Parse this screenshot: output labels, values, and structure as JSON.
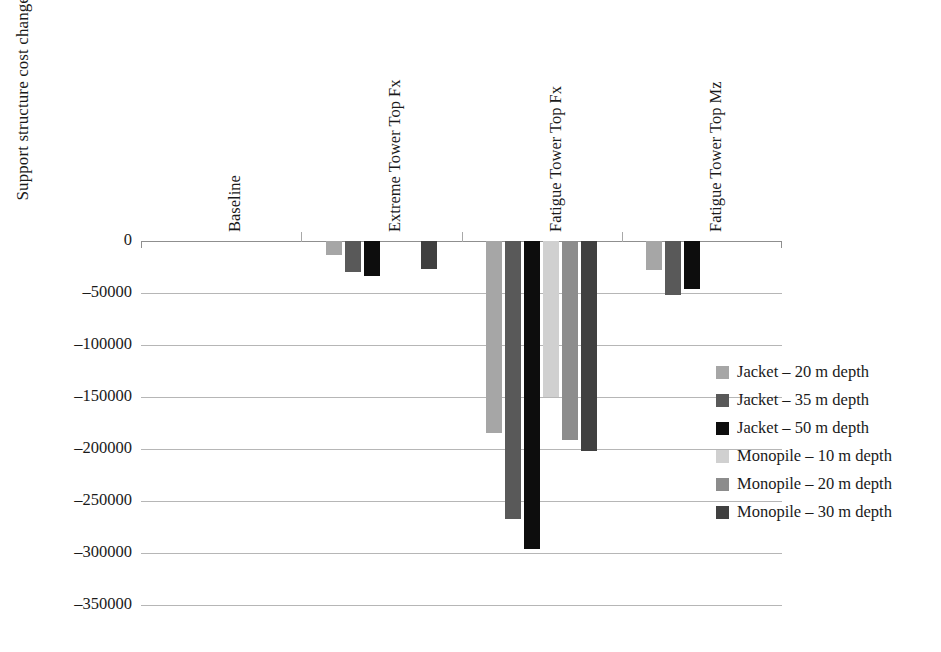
{
  "chart_data": {
    "type": "bar",
    "title": "",
    "xlabel": "",
    "ylabel": "Support structure cost change (€)",
    "ylim": [
      -350000,
      0
    ],
    "ytick_values": [
      0,
      -50000,
      -100000,
      -150000,
      -200000,
      -250000,
      -300000,
      -350000
    ],
    "ytick_labels": [
      "0",
      "–50000",
      "–100000",
      "–150000",
      "–200000",
      "–250000",
      "–300000",
      "–350000"
    ],
    "grid": true,
    "legend_position": "right",
    "categories": [
      "Baseline",
      "Extreme Tower Top Fx",
      "Fatigue Tower Top Fx",
      "Fatigue Tower Top Mz"
    ],
    "series": [
      {
        "name": "Jacket – 20 m depth",
        "color": "#a6a6a6",
        "values": [
          0,
          -13000,
          -185000,
          -28000
        ]
      },
      {
        "name": "Jacket – 35 m depth",
        "color": "#595959",
        "values": [
          0,
          -30000,
          -267000,
          -52000
        ]
      },
      {
        "name": "Jacket – 50 m depth",
        "color": "#0d0d0d",
        "values": [
          0,
          -34000,
          -296000,
          -46000
        ]
      },
      {
        "name": "Monopile – 10 m depth",
        "color": "#d0d0d0",
        "values": [
          0,
          0,
          -150000,
          0
        ]
      },
      {
        "name": "Monopile – 20 m depth",
        "color": "#8c8c8c",
        "values": [
          0,
          0,
          -191000,
          0
        ]
      },
      {
        "name": "Monopile – 30 m depth",
        "color": "#404040",
        "values": [
          0,
          -27000,
          -202000,
          0
        ]
      }
    ]
  },
  "legend": {
    "items": [
      "Jacket – 20 m depth",
      "Jacket – 35 m depth",
      "Jacket – 50 m depth",
      "Monopile – 10 m depth",
      "Monopile – 20 m depth",
      "Monopile – 30 m depth"
    ]
  }
}
